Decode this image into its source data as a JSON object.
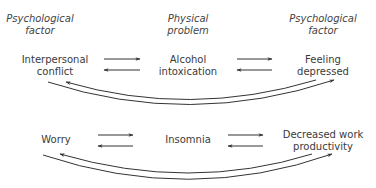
{
  "headers": [
    {
      "line1": "Psychological",
      "line2": "factor"
    },
    {
      "line1": "Physical",
      "line2": "problem"
    },
    {
      "line1": "Psychological",
      "line2": "factor"
    }
  ],
  "row1": {
    "left": {
      "line1": "Interpersonal",
      "line2": "conflict"
    },
    "middle": {
      "line1": "Alcohol",
      "line2": "intoxication"
    },
    "right": {
      "line1": "Feeling",
      "line2": "depressed"
    }
  },
  "row2": {
    "left": {
      "line1": "Worry"
    },
    "middle": {
      "line1": "Insomnia"
    },
    "right": {
      "line1": "Decreased work",
      "line2": "productivity"
    }
  },
  "colors": {
    "line": "#333333",
    "text": "#3a3a3a"
  }
}
